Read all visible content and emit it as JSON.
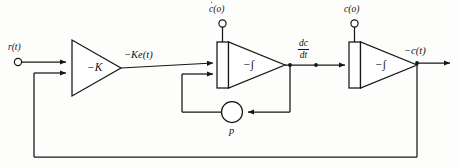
{
  "diagram": {
    "type": "block-diagram",
    "stroke_color": "#161616",
    "background_color": "#fdfdfc",
    "width": 459,
    "height": 168,
    "labels": {
      "input_terminal": "r(t)",
      "amplifier_gain": "−K",
      "amplifier_output": "−Ke(t)",
      "first_integrator": "−∫",
      "first_integrator_ic": "c(o)",
      "first_integrator_ic_dotted": true,
      "derivative_signal_numerator": "dc",
      "derivative_signal_denominator": "dt",
      "second_integrator": "−∫",
      "second_integrator_ic": "c(o)",
      "second_integrator_ic_dotted": false,
      "feedback_gain": "p",
      "output_signal": "−c(t)"
    },
    "blocks": [
      {
        "id": "amplifier",
        "kind": "triangle-amplifier",
        "label": "−K",
        "inputs": 2,
        "outputs": 1
      },
      {
        "id": "integrator-1",
        "kind": "integrator",
        "label": "−∫",
        "inputs": 2,
        "outputs": 1,
        "initial_condition": "c(o)"
      },
      {
        "id": "summing-gain",
        "kind": "circle-gain",
        "label": "p",
        "inputs": 1,
        "outputs": 1
      },
      {
        "id": "integrator-2",
        "kind": "integrator",
        "label": "−∫",
        "inputs": 1,
        "outputs": 1,
        "initial_condition": "c(o)"
      }
    ],
    "signals": [
      {
        "from": "input-terminal",
        "to": "amplifier",
        "label": "r(t)"
      },
      {
        "from": "amplifier",
        "to": "integrator-1",
        "label": "−Ke(t)"
      },
      {
        "from": "integrator-1",
        "to": "integrator-2",
        "label": "dc/dt"
      },
      {
        "from": "integrator-1",
        "to": "summing-gain",
        "label": ""
      },
      {
        "from": "summing-gain",
        "to": "integrator-1",
        "label": "p"
      },
      {
        "from": "integrator-2",
        "to": "output-terminal",
        "label": "−c(t)"
      },
      {
        "from": "output-terminal",
        "to": "amplifier",
        "label": "feedback"
      }
    ]
  }
}
